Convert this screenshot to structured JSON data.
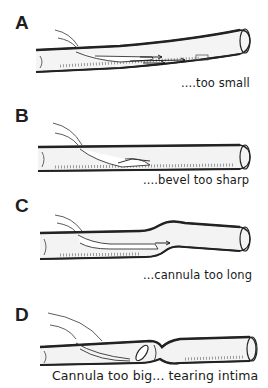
{
  "figure": {
    "panels": [
      {
        "letter": "A",
        "caption": "....too small"
      },
      {
        "letter": "B",
        "caption": "....bevel too sharp"
      },
      {
        "letter": "C",
        "caption": "...cannula too long"
      },
      {
        "letter": "D",
        "caption": "Cannula too big... tearing intima"
      }
    ],
    "colors": {
      "ink": "#1a1a1a",
      "shade": "#8a8a8a",
      "background": "#ffffff"
    }
  }
}
